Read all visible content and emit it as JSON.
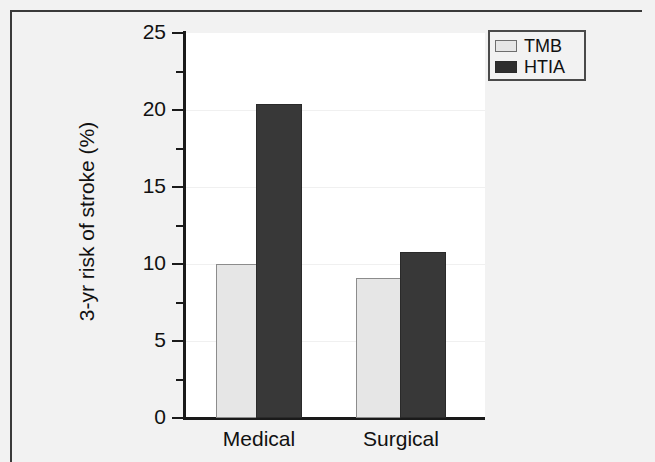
{
  "chart_data": {
    "type": "bar",
    "title": "",
    "subtitle": "",
    "xlabel": "",
    "ylabel": "3-yr risk of stroke (%)",
    "categories": [
      "Medical",
      "Surgical"
    ],
    "series": [
      {
        "name": "TMB",
        "values": [
          10.0,
          9.1
        ],
        "color": "#e6e6e6"
      },
      {
        "name": "HTIA",
        "values": [
          20.4,
          10.8
        ],
        "color": "#383838"
      }
    ],
    "ylim": [
      0,
      25
    ],
    "ytick_major": [
      0,
      5,
      10,
      15,
      20,
      25
    ],
    "ytick_minor": [
      2.5,
      7.5,
      12.5,
      17.5,
      22.5
    ],
    "ytick_labels": [
      "0",
      "5",
      "10",
      "15",
      "20",
      "25"
    ],
    "grid": false,
    "legend_position": "top-right",
    "legend_entries": [
      "TMB",
      "HTIA"
    ],
    "annotations": []
  },
  "axis": {
    "y_title": "3-yr risk of stroke (%)",
    "tick_25": "25",
    "tick_20": "20",
    "tick_15": "15",
    "tick_10": "10",
    "tick_5": "5",
    "tick_0": "0"
  },
  "groups": {
    "medical": "Medical",
    "surgical": "Surgical"
  },
  "legend": {
    "tmb_label": "TMB",
    "htia_label": "HTIA"
  },
  "colors": {
    "light_bar": "#e6e6e6",
    "dark_bar": "#383838",
    "axis": "#1a1a1a",
    "plot_background": "#ffffff",
    "figure_background": "#f2f2f2"
  }
}
